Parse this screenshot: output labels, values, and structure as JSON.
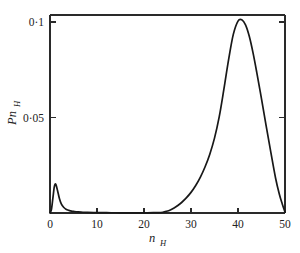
{
  "chart_data": {
    "type": "line",
    "title": "",
    "subtitle": "",
    "xlabel": "n_H",
    "xlabel_base": "n",
    "xlabel_sub": "H",
    "ylabel": "Pn_H",
    "ylabel_base": "Pn",
    "ylabel_sub": "H",
    "xlim": [
      0,
      50
    ],
    "ylim": [
      0,
      0.11
    ],
    "grid": false,
    "legend": null,
    "legend_position": "none",
    "frame": "box",
    "line_color": "#181818",
    "axis_color": "#2a2a2a",
    "background_color": "#ffffff",
    "xticks": [
      0,
      10,
      20,
      30,
      40,
      50
    ],
    "xticklabels": [
      "0",
      "10",
      "20",
      "30",
      "40",
      "50"
    ],
    "yticks": [
      0.05,
      0.1
    ],
    "yticklabels": [
      "0·05",
      "0·1"
    ],
    "series": [
      {
        "name": "P(n_H)",
        "x": [
          0.0,
          0.3,
          0.6,
          0.9,
          1.1,
          1.3,
          1.6,
          2.0,
          2.4,
          2.9,
          3.4,
          4.0,
          4.6,
          5.2,
          6.0,
          7.0,
          8.0,
          10.0,
          12.0,
          14.0,
          16.0,
          18.0,
          20.0,
          22.0,
          23.0,
          24.0,
          24.8,
          25.6,
          26.4,
          27.2,
          28.0,
          29.0,
          30.0,
          31.0,
          32.0,
          33.0,
          34.0,
          35.0,
          36.0,
          37.0,
          38.0,
          39.0,
          40.0,
          40.8,
          41.6,
          42.4,
          43.2,
          44.0,
          45.0,
          46.0,
          47.0,
          48.0,
          48.8,
          49.4,
          50.0
        ],
        "y": [
          0.0,
          0.0018,
          0.0075,
          0.0135,
          0.0152,
          0.0146,
          0.0118,
          0.0076,
          0.0048,
          0.003,
          0.002,
          0.0014,
          0.001,
          0.0008,
          0.0006,
          0.0004,
          0.0003,
          0.0002,
          0.00015,
          0.00012,
          0.0001,
          0.0001,
          0.0001,
          0.00015,
          0.0002,
          0.0004,
          0.0009,
          0.0016,
          0.0026,
          0.0039,
          0.0055,
          0.0079,
          0.0108,
          0.0144,
          0.0188,
          0.0242,
          0.0308,
          0.0392,
          0.0503,
          0.0648,
          0.0803,
          0.0935,
          0.1005,
          0.1012,
          0.0985,
          0.0925,
          0.0838,
          0.0735,
          0.0598,
          0.0455,
          0.0316,
          0.0182,
          0.0098,
          0.0049,
          0.0005
        ]
      }
    ],
    "annotations": [
      {
        "text": "primary peak",
        "x": 41,
        "y": 0.101
      },
      {
        "text": "secondary peak",
        "x": 1.1,
        "y": 0.0152
      }
    ]
  }
}
